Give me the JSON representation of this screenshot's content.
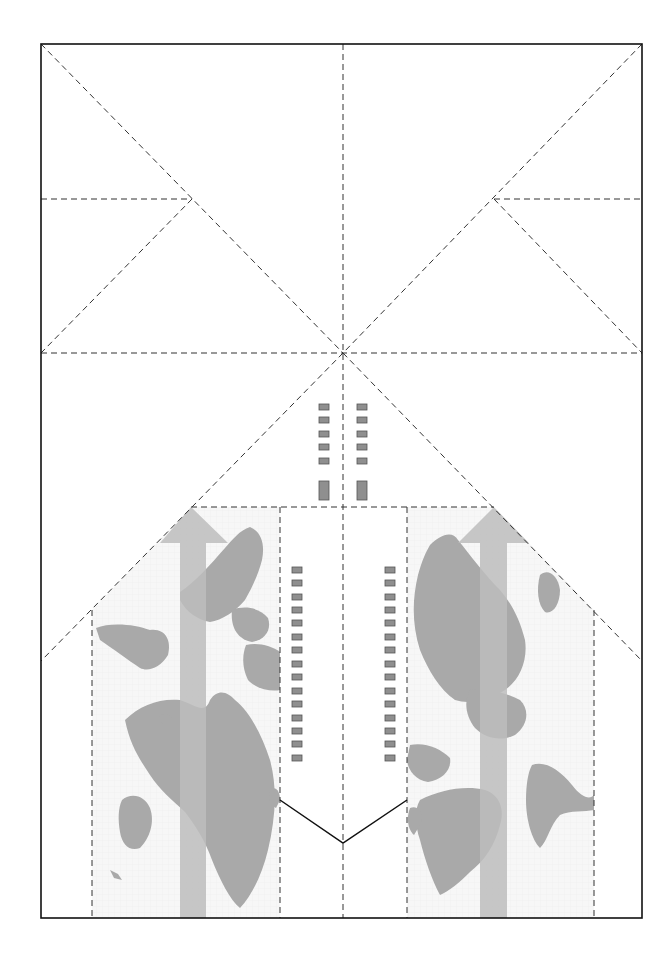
{
  "colors": {
    "background": "#ffffff",
    "frame": "#111111",
    "fold_lines": "#333333",
    "map_land": "#a9a9a9",
    "map_bg": "#f6f6f6",
    "arrow": "#bdbdbd",
    "windows": "#8f8f8f"
  },
  "sheet": {
    "left": 41,
    "top": 44,
    "right": 642,
    "bottom": 918
  },
  "center_point": {
    "x": 343,
    "y": 353
  },
  "fold_lines": {
    "type": "dashed",
    "count_described": [
      "vertical-center",
      "horizontal-center",
      "two-top-diagonals",
      "two-upper-horizontal-flaps",
      "two-lower-diagonals",
      "map-panel-borders"
    ]
  },
  "windows": {
    "upper_pairs": 5,
    "upper_doors": 1,
    "side_columns_count": 15
  },
  "map_panels": [
    {
      "name": "left-map-panel",
      "arrow_direction": "up"
    },
    {
      "name": "right-map-panel",
      "arrow_direction": "up"
    }
  ],
  "tail_notch": {
    "type": "solid-v",
    "apex": {
      "x": 343,
      "y": 843
    }
  }
}
